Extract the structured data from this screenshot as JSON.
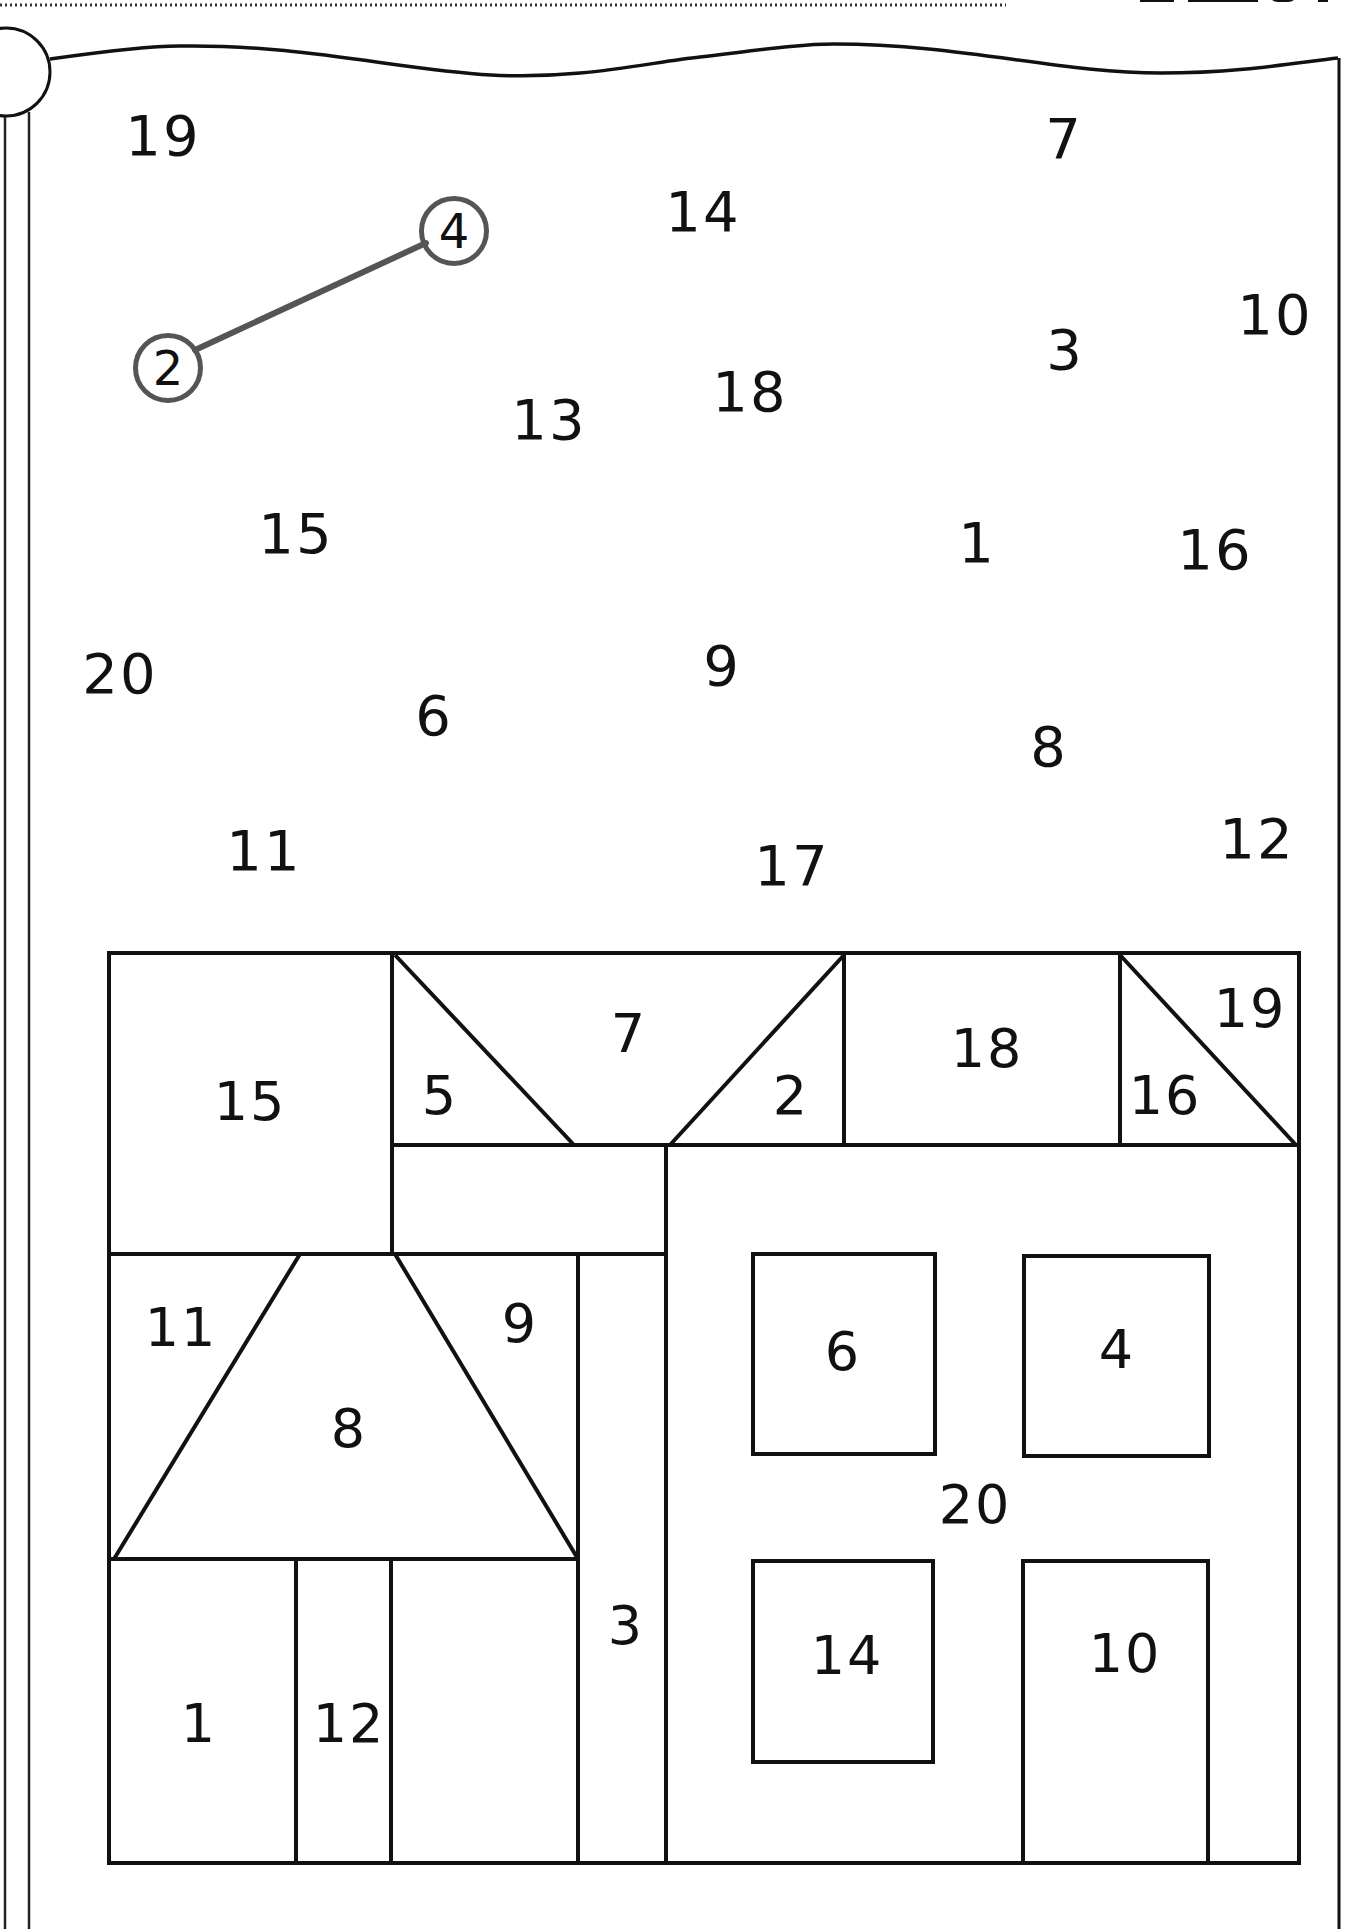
{
  "worksheet": {
    "type": "dot-to-dot number matching",
    "example": {
      "from_number": "2",
      "to_number": "4",
      "line_color": "#555555"
    },
    "scattered_numbers": [
      {
        "label": "19",
        "x": 163,
        "y": 136
      },
      {
        "label": "7",
        "x": 1064,
        "y": 139
      },
      {
        "label": "14",
        "x": 703,
        "y": 212
      },
      {
        "label": "10",
        "x": 1275,
        "y": 315
      },
      {
        "label": "3",
        "x": 1065,
        "y": 350
      },
      {
        "label": "18",
        "x": 750,
        "y": 392
      },
      {
        "label": "13",
        "x": 549,
        "y": 420
      },
      {
        "label": "15",
        "x": 296,
        "y": 534
      },
      {
        "label": "1",
        "x": 977,
        "y": 543
      },
      {
        "label": "16",
        "x": 1215,
        "y": 550
      },
      {
        "label": "20",
        "x": 120,
        "y": 674
      },
      {
        "label": "9",
        "x": 722,
        "y": 666
      },
      {
        "label": "6",
        "x": 434,
        "y": 716
      },
      {
        "label": "8",
        "x": 1049,
        "y": 747
      },
      {
        "label": "11",
        "x": 264,
        "y": 851
      },
      {
        "label": "12",
        "x": 1257,
        "y": 839
      },
      {
        "label": "17",
        "x": 792,
        "y": 866
      }
    ],
    "circled_numbers": [
      {
        "label": "4",
        "x": 454,
        "y": 231
      },
      {
        "label": "2",
        "x": 168,
        "y": 368
      }
    ],
    "house_regions": [
      {
        "label": "15",
        "x": 250,
        "y": 1102
      },
      {
        "label": "5",
        "x": 440,
        "y": 1096
      },
      {
        "label": "7",
        "x": 629,
        "y": 1034
      },
      {
        "label": "2",
        "x": 791,
        "y": 1096
      },
      {
        "label": "18",
        "x": 987,
        "y": 1049
      },
      {
        "label": "16",
        "x": 1165,
        "y": 1096
      },
      {
        "label": "19",
        "x": 1250,
        "y": 1009
      },
      {
        "label": "11",
        "x": 181,
        "y": 1328
      },
      {
        "label": "9",
        "x": 520,
        "y": 1324
      },
      {
        "label": "8",
        "x": 349,
        "y": 1429
      },
      {
        "label": "6",
        "x": 843,
        "y": 1352
      },
      {
        "label": "4",
        "x": 1117,
        "y": 1350
      },
      {
        "label": "20",
        "x": 975,
        "y": 1505
      },
      {
        "label": "3",
        "x": 626,
        "y": 1626
      },
      {
        "label": "14",
        "x": 847,
        "y": 1656
      },
      {
        "label": "10",
        "x": 1125,
        "y": 1654
      },
      {
        "label": "1",
        "x": 199,
        "y": 1724
      },
      {
        "label": "12",
        "x": 349,
        "y": 1724
      }
    ]
  },
  "colors": {
    "ink": "#111111",
    "example_line": "#555555",
    "paper": "#ffffff"
  }
}
